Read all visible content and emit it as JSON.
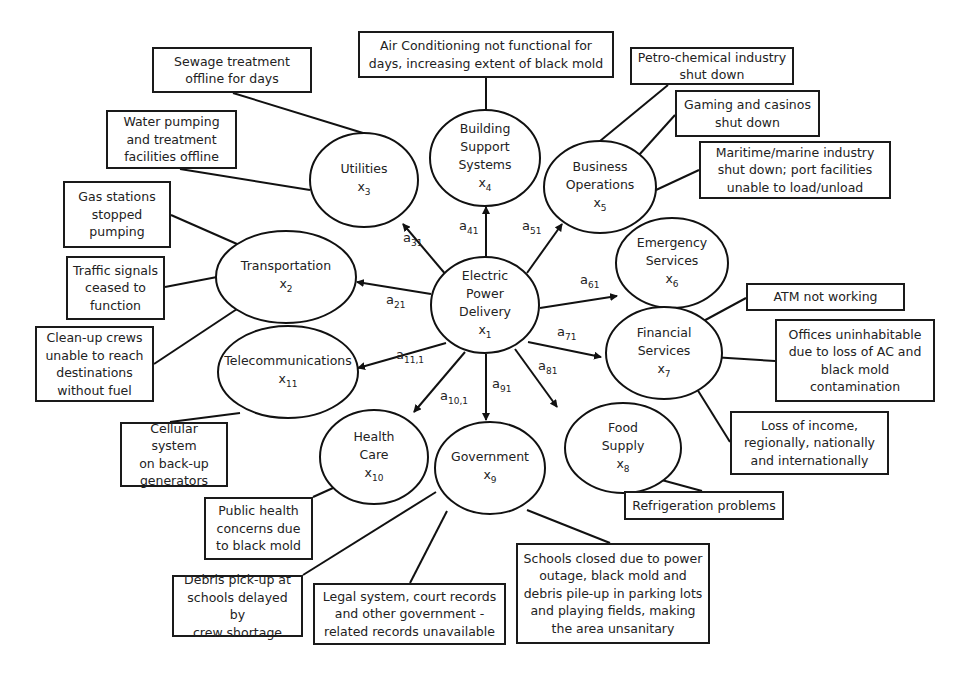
{
  "diagram": {
    "type": "influence-network",
    "central_node": {
      "id": "x1",
      "label": "Electric\nPower\nDelivery",
      "symbol": "x",
      "subscript": "1",
      "cx": 485,
      "cy": 305,
      "rx": 54,
      "ry": 48
    },
    "nodes": [
      {
        "id": "x2",
        "label": "Transportation",
        "symbol": "x",
        "subscript": "2",
        "cx": 286,
        "cy": 277,
        "rx": 70,
        "ry": 46,
        "coef": "a",
        "coef_sub": "21",
        "coef_x": 386,
        "coef_y": 302,
        "arrow_from": [
          431,
          294
        ],
        "arrow_to": [
          357,
          282
        ]
      },
      {
        "id": "x3",
        "label": "Utilities",
        "symbol": "x",
        "subscript": "3",
        "cx": 364,
        "cy": 180,
        "rx": 54,
        "ry": 47,
        "coef": "a",
        "coef_sub": "31",
        "coef_x": 403,
        "coef_y": 240,
        "arrow_from": [
          447,
          276
        ],
        "arrow_to": [
          403,
          224
        ]
      },
      {
        "id": "x4",
        "label": "Building\nSupport\nSystems",
        "symbol": "x",
        "subscript": "4",
        "cx": 485,
        "cy": 158,
        "rx": 55,
        "ry": 48,
        "coef": "a",
        "coef_sub": "41",
        "coef_x": 459,
        "coef_y": 228,
        "arrow_from": [
          486,
          257
        ],
        "arrow_to": [
          486,
          207
        ]
      },
      {
        "id": "x5",
        "label": "Business\nOperations",
        "symbol": "x",
        "subscript": "5",
        "cx": 600,
        "cy": 187,
        "rx": 56,
        "ry": 46,
        "coef": "a",
        "coef_sub": "51",
        "coef_x": 522,
        "coef_y": 228,
        "arrow_from": [
          527,
          273
        ],
        "arrow_to": [
          562,
          224
        ]
      },
      {
        "id": "x6",
        "label": "Emergency\nServices",
        "symbol": "x",
        "subscript": "6",
        "cx": 672,
        "cy": 263,
        "rx": 56,
        "ry": 45,
        "coef": "a",
        "coef_sub": "61",
        "coef_x": 580,
        "coef_y": 282,
        "arrow_from": [
          540,
          308
        ],
        "arrow_to": [
          617,
          296
        ]
      },
      {
        "id": "x7",
        "label": "Financial\nServices",
        "symbol": "x",
        "subscript": "7",
        "cx": 664,
        "cy": 353,
        "rx": 58,
        "ry": 46,
        "coef": "a",
        "coef_sub": "71",
        "coef_x": 557,
        "coef_y": 334,
        "arrow_from": [
          528,
          342
        ],
        "arrow_to": [
          601,
          357
        ]
      },
      {
        "id": "x8",
        "label": "Food\nSupply",
        "symbol": "x",
        "subscript": "8",
        "cx": 623,
        "cy": 448,
        "rx": 58,
        "ry": 45,
        "coef": "a",
        "coef_sub": "81",
        "coef_x": 538,
        "coef_y": 368,
        "arrow_from": [
          515,
          349
        ],
        "arrow_to": [
          557,
          407
        ]
      },
      {
        "id": "x9",
        "label": "Government",
        "symbol": "x",
        "subscript": "9",
        "cx": 490,
        "cy": 468,
        "rx": 55,
        "ry": 46,
        "coef": "a",
        "coef_sub": "91",
        "coef_x": 492,
        "coef_y": 386,
        "arrow_from": [
          486,
          354
        ],
        "arrow_to": [
          486,
          420
        ]
      },
      {
        "id": "x10",
        "label": "Health\nCare",
        "symbol": "x",
        "subscript": "10",
        "cx": 374,
        "cy": 457,
        "rx": 54,
        "ry": 47,
        "coef": "a",
        "coef_sub": "10,1",
        "coef_x": 440,
        "coef_y": 398,
        "arrow_from": [
          465,
          352
        ],
        "arrow_to": [
          414,
          412
        ]
      },
      {
        "id": "x11",
        "label": "Telecommunications",
        "symbol": "x",
        "subscript": "11",
        "cx": 288,
        "cy": 372,
        "rx": 70,
        "ry": 46,
        "coef": "a",
        "coef_sub": "11,1",
        "coef_x": 396,
        "coef_y": 357,
        "arrow_from": [
          446,
          343
        ],
        "arrow_to": [
          358,
          368
        ]
      }
    ],
    "impact_boxes": [
      {
        "id": "b1",
        "text": "Sewage treatment\noffline for days",
        "x": 152,
        "y": 47,
        "w": 160,
        "h": 46,
        "node": "x3",
        "line": [
          [
            233,
            93
          ],
          [
            363,
            133
          ]
        ]
      },
      {
        "id": "b2",
        "text": "Water pumping\nand treatment\nfacilities offline",
        "x": 106,
        "y": 110,
        "w": 131,
        "h": 59,
        "node": "x3",
        "line": [
          [
            180,
            169
          ],
          [
            310,
            190
          ]
        ]
      },
      {
        "id": "b3",
        "text": "Gas stations\nstopped\npumping",
        "x": 63,
        "y": 181,
        "w": 108,
        "h": 67,
        "node": "x2",
        "line": [
          [
            171,
            215
          ],
          [
            237,
            244
          ]
        ]
      },
      {
        "id": "b4",
        "text": "Traffic signals\nceased to\nfunction",
        "x": 66,
        "y": 256,
        "w": 99,
        "h": 64,
        "node": "x2",
        "line": [
          [
            165,
            287
          ],
          [
            217,
            277
          ]
        ]
      },
      {
        "id": "b5",
        "text": "Clean-up crews\nunable to reach\ndestinations\nwithout fuel",
        "x": 35,
        "y": 326,
        "w": 119,
        "h": 76,
        "node": "x2",
        "line": [
          [
            154,
            364
          ],
          [
            237,
            309
          ]
        ]
      },
      {
        "id": "b6",
        "text": "Cellular system\non back-up\ngenerators",
        "x": 120,
        "y": 422,
        "w": 108,
        "h": 65,
        "node": "x11",
        "line": [
          [
            170,
            422
          ],
          [
            240,
            413
          ]
        ]
      },
      {
        "id": "b7",
        "text": "Public health\nconcerns due\nto black mold",
        "x": 204,
        "y": 497,
        "w": 109,
        "h": 63,
        "node": "x10",
        "line": [
          [
            313,
            497
          ],
          [
            333,
            488
          ]
        ]
      },
      {
        "id": "b8",
        "text": "Debris pick-up at\nschools delayed by\ncrew shortage",
        "x": 172,
        "y": 575,
        "w": 131,
        "h": 62,
        "node": "x9",
        "line": [
          [
            303,
            575
          ],
          [
            436,
            492
          ]
        ]
      },
      {
        "id": "b9",
        "text": "Legal system, court records\nand other government -\nrelated records unavailable",
        "x": 313,
        "y": 583,
        "w": 193,
        "h": 62,
        "node": "x9",
        "line": [
          [
            410,
            583
          ],
          [
            447,
            511
          ]
        ]
      },
      {
        "id": "b10",
        "text": "Schools closed due to power\noutage, black mold and\ndebris pile-up in parking lots\nand playing fields, making\nthe area unsanitary",
        "x": 516,
        "y": 543,
        "w": 194,
        "h": 101,
        "node": "x9",
        "line": [
          [
            610,
            543
          ],
          [
            527,
            510
          ]
        ]
      },
      {
        "id": "b11",
        "text": "Refrigeration problems",
        "x": 624,
        "y": 491,
        "w": 160,
        "h": 29,
        "node": "x8",
        "line": [
          [
            702,
            491
          ],
          [
            636,
            473
          ]
        ]
      },
      {
        "id": "b12",
        "text": "Loss of income,\nregionally, nationally\nand internationally",
        "x": 730,
        "y": 411,
        "w": 159,
        "h": 64,
        "node": "x7",
        "line": [
          [
            730,
            442
          ],
          [
            697,
            389
          ]
        ]
      },
      {
        "id": "b13",
        "text": "Offices uninhabitable\ndue to loss of AC and\nblack mold\ncontamination",
        "x": 775,
        "y": 319,
        "w": 160,
        "h": 83,
        "node": "x7",
        "line": [
          [
            775,
            361
          ],
          [
            712,
            357
          ]
        ]
      },
      {
        "id": "b14",
        "text": "ATM not working",
        "x": 746,
        "y": 283,
        "w": 159,
        "h": 28,
        "node": "x7",
        "line": [
          [
            746,
            298
          ],
          [
            698,
            324
          ]
        ]
      },
      {
        "id": "b15",
        "text": "Maritime/marine industry\nshut down; port facilities\nunable to load/unload",
        "x": 699,
        "y": 141,
        "w": 192,
        "h": 58,
        "node": "x5",
        "line": [
          [
            699,
            170
          ],
          [
            656,
            190
          ]
        ]
      },
      {
        "id": "b16",
        "text": "Gaming and casinos\nshut down",
        "x": 675,
        "y": 90,
        "w": 145,
        "h": 47,
        "node": "x5",
        "line": [
          [
            675,
            115
          ],
          [
            639,
            155
          ]
        ]
      },
      {
        "id": "b17",
        "text": "Petro-chemical industry\nshut down",
        "x": 630,
        "y": 47,
        "w": 164,
        "h": 38,
        "node": "x5",
        "line": [
          [
            668,
            85
          ],
          [
            600,
            141
          ]
        ]
      },
      {
        "id": "b18",
        "text": "Air Conditioning not functional for\ndays, increasing extent of black mold",
        "x": 358,
        "y": 31,
        "w": 256,
        "h": 47,
        "node": "x4",
        "line": [
          [
            486,
            78
          ],
          [
            486,
            110
          ]
        ]
      }
    ]
  }
}
